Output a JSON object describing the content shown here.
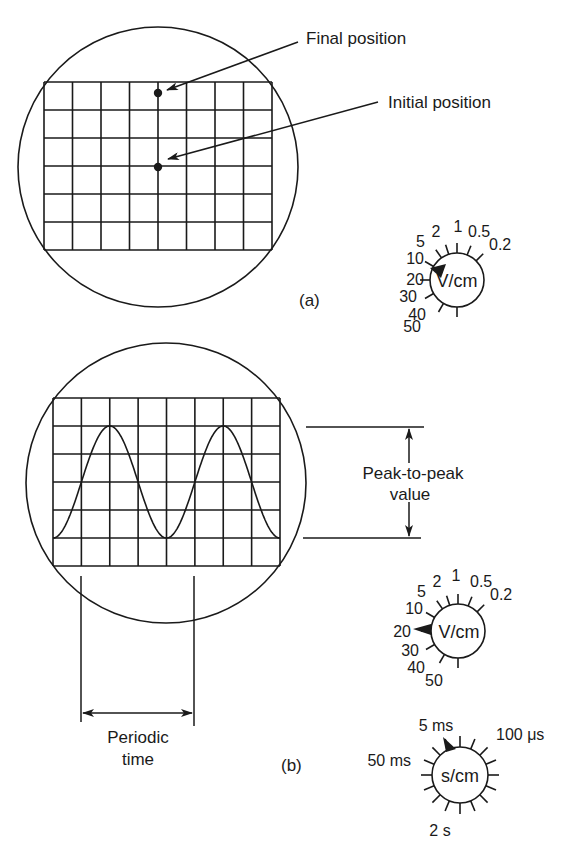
{
  "figure_a": {
    "label": "(a)",
    "annotations": {
      "final_position": "Final position",
      "initial_position": "Initial position"
    },
    "grid": {
      "columns": 8,
      "rows": 6
    },
    "dots": [
      {
        "name": "final-position-dot",
        "col": 4,
        "row": 0.4
      },
      {
        "name": "initial-position-dot",
        "col": 4,
        "row": 3
      }
    ],
    "volts_dial": {
      "unit": "V/cm",
      "ticks": [
        "50",
        "40",
        "30",
        "20",
        "10",
        "5",
        "2",
        "1",
        "0.5",
        "0.2"
      ],
      "selected": "10"
    }
  },
  "figure_b": {
    "label": "(b)",
    "annotations": {
      "peak_to_peak_line1": "Peak-to-peak",
      "peak_to_peak_line2": "value",
      "periodic_line1": "Periodic",
      "periodic_line2": "time"
    },
    "grid": {
      "columns": 8,
      "rows": 6
    },
    "waveform": {
      "type": "sine",
      "cycles_shown": 2,
      "peak_to_peak_divisions": 4,
      "period_divisions": 4
    },
    "volts_dial": {
      "unit": "V/cm",
      "ticks": [
        "50",
        "40",
        "30",
        "20",
        "10",
        "5",
        "2",
        "1",
        "0.5",
        "0.2"
      ],
      "selected": "20"
    },
    "time_dial": {
      "unit": "s/cm",
      "labels": {
        "top_left": "5 ms",
        "left": "50 ms",
        "top_right": "100 μs",
        "bottom": "2 s"
      },
      "selected": "5 ms"
    }
  }
}
